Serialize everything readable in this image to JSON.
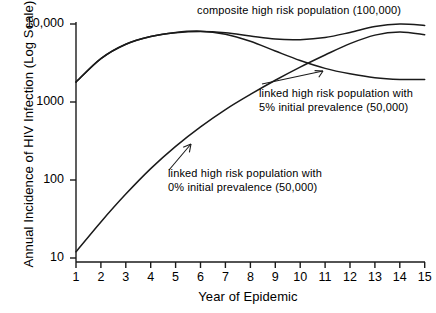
{
  "chart_data": {
    "type": "line",
    "title": "",
    "xlabel": "Year of Epidemic",
    "ylabel": "Annual Incidence of HIV Infection (Log Scale)",
    "yscale": "log",
    "ylim": [
      10,
      10000
    ],
    "xlim": [
      1,
      15
    ],
    "grid": false,
    "legend": "inline-annotations",
    "x_ticks": [
      "1",
      "2",
      "3",
      "4",
      "5",
      "6",
      "7",
      "8",
      "9",
      "10",
      "11",
      "12",
      "13",
      "14",
      "15"
    ],
    "y_ticks": [
      "10",
      "100",
      "1000",
      "10,000"
    ],
    "x": [
      1,
      2,
      3,
      4,
      5,
      6,
      7,
      8,
      9,
      10,
      11,
      12,
      13,
      14,
      15
    ],
    "series": [
      {
        "name": "composite high risk population (100,000)",
        "values": [
          1800,
          3600,
          5500,
          6900,
          7700,
          8000,
          7700,
          7000,
          6400,
          6300,
          6700,
          7800,
          9300,
          10000,
          9600
        ]
      },
      {
        "name": "linked high risk population with 5% initial prevalence (50,000)",
        "values": [
          1800,
          3600,
          5500,
          6900,
          7800,
          8100,
          7400,
          6000,
          4500,
          3400,
          2700,
          2300,
          2050,
          1950,
          1950
        ]
      },
      {
        "name": "linked high risk population with 0% initial prevalence (50,000)",
        "values": [
          12,
          29,
          66,
          140,
          270,
          480,
          800,
          1250,
          1900,
          2800,
          4000,
          5600,
          7200,
          7900,
          7300
        ]
      }
    ],
    "annotations": [
      {
        "id": "composite-label",
        "lines": [
          "composite high risk population (100,000)"
        ],
        "has_arrow": false
      },
      {
        "id": "linked-5pct-label",
        "lines": [
          "linked high risk population with",
          "5% initial prevalence (50,000)"
        ],
        "has_arrow": true
      },
      {
        "id": "linked-0pct-label",
        "lines": [
          "linked high risk population with",
          "0% initial prevalence (50,000)"
        ],
        "has_arrow": true
      }
    ]
  },
  "axes": {
    "y_title": "Annual Incidence of HIV Infection (Log Scale)",
    "x_title": "Year of Epidemic",
    "y_ticks": [
      {
        "label": "10,000"
      },
      {
        "label": "1000"
      },
      {
        "label": "100"
      },
      {
        "label": "10"
      }
    ],
    "x_ticks": [
      {
        "label": "1"
      },
      {
        "label": "2"
      },
      {
        "label": "3"
      },
      {
        "label": "4"
      },
      {
        "label": "5"
      },
      {
        "label": "6"
      },
      {
        "label": "7"
      },
      {
        "label": "8"
      },
      {
        "label": "9"
      },
      {
        "label": "10"
      },
      {
        "label": "11"
      },
      {
        "label": "12"
      },
      {
        "label": "13"
      },
      {
        "label": "14"
      },
      {
        "label": "15"
      }
    ]
  },
  "annotations": {
    "composite": "composite high risk population (100,000)",
    "linked5_line1": "linked high risk population with",
    "linked5_line2": "5% initial prevalence (50,000)",
    "linked0_line1": "linked high risk population with",
    "linked0_line2": "0% initial prevalence (50,000)"
  },
  "style": {
    "line_color": "#1a1a1a",
    "axis_color": "#1a1a1a",
    "background": "#ffffff"
  }
}
